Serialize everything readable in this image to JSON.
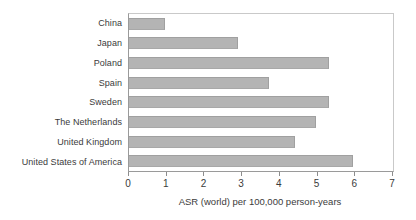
{
  "chart_data": {
    "type": "bar",
    "orientation": "horizontal",
    "title": "",
    "xlabel": "ASR (world) per 100,000 person-years",
    "ylabel": "",
    "categories": [
      "China",
      "Japan",
      "Poland",
      "Spain",
      "Sweden",
      "The Netherlands",
      "United Kingdom",
      "United States of America"
    ],
    "values": [
      0.95,
      2.9,
      5.3,
      3.7,
      5.3,
      4.95,
      4.4,
      5.95
    ],
    "xlim": [
      0,
      7
    ],
    "xticks": [
      0,
      1,
      2,
      3,
      4,
      5,
      6,
      7
    ],
    "xtick_labels": [
      "0",
      "1",
      "2",
      "3",
      "4",
      "5",
      "6",
      "7"
    ],
    "grid": false,
    "legend": null,
    "bar_color": "#b4b4b4",
    "axis_color": "#9a9a9a",
    "text_color": "#3b3b3b"
  }
}
